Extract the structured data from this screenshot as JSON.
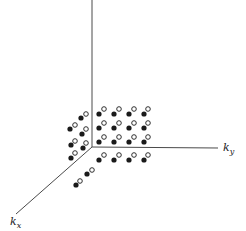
{
  "diagram": {
    "colors": {
      "axis": "#4a4a4a",
      "dot": "#1a1a1a",
      "background": "#ffffff"
    },
    "axes": {
      "origin": [
        92,
        147
      ],
      "vertical": {
        "end": [
          92,
          0
        ],
        "label": ""
      },
      "ky": {
        "end": [
          218,
          148
        ],
        "label_main": "k",
        "label_sub": "y",
        "label_pos": [
          223,
          151
        ]
      },
      "kx": {
        "end": [
          16,
          214
        ],
        "label_main": "k",
        "label_sub": "x",
        "label_pos": [
          10,
          225
        ]
      }
    },
    "point_pairs": [
      {
        "filled": [
          99,
          114
        ],
        "hollow": [
          104,
          109
        ]
      },
      {
        "filled": [
          114,
          114
        ],
        "hollow": [
          119,
          109
        ]
      },
      {
        "filled": [
          129,
          114
        ],
        "hollow": [
          134,
          109
        ]
      },
      {
        "filled": [
          144,
          114
        ],
        "hollow": [
          148,
          109
        ]
      },
      {
        "filled": [
          99,
          128
        ],
        "hollow": [
          104,
          123
        ]
      },
      {
        "filled": [
          114,
          128
        ],
        "hollow": [
          119,
          123
        ]
      },
      {
        "filled": [
          129,
          128
        ],
        "hollow": [
          134,
          123
        ]
      },
      {
        "filled": [
          144,
          128
        ],
        "hollow": [
          148,
          123
        ]
      },
      {
        "filled": [
          99,
          142
        ],
        "hollow": [
          104,
          137
        ]
      },
      {
        "filled": [
          114,
          142
        ],
        "hollow": [
          119,
          137
        ]
      },
      {
        "filled": [
          129,
          142
        ],
        "hollow": [
          134,
          137
        ]
      },
      {
        "filled": [
          144,
          142
        ],
        "hollow": [
          148,
          137
        ]
      },
      {
        "filled": [
          99,
          160
        ],
        "hollow": [
          104,
          155
        ]
      },
      {
        "filled": [
          114,
          160
        ],
        "hollow": [
          119,
          155
        ]
      },
      {
        "filled": [
          129,
          160
        ],
        "hollow": [
          134,
          155
        ]
      },
      {
        "filled": [
          144,
          160
        ],
        "hollow": [
          148,
          155
        ]
      },
      {
        "filled": [
          81,
          118
        ],
        "hollow": [
          86,
          114
        ]
      },
      {
        "filled": [
          70,
          129
        ],
        "hollow": [
          75,
          125
        ]
      },
      {
        "filled": [
          82,
          134
        ],
        "hollow": [
          86,
          129
        ]
      },
      {
        "filled": [
          71,
          145
        ],
        "hollow": [
          75,
          141
        ]
      },
      {
        "filled": [
          83,
          148
        ],
        "hollow": [
          86,
          143
        ]
      },
      {
        "filled": [
          71,
          158
        ],
        "hollow": [
          75,
          153
        ]
      },
      {
        "filled": [
          87,
          174
        ],
        "hollow": [
          92,
          170
        ]
      },
      {
        "filled": [
          76,
          185
        ],
        "hollow": [
          80,
          181
        ]
      }
    ]
  }
}
